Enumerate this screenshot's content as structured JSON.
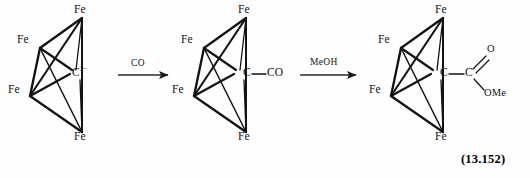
{
  "figure": {
    "equation_number": "(13.152)",
    "background_color": "#fefefe",
    "line_color": "#111111"
  },
  "structures": [
    {
      "id": "reactant-carbide-cluster",
      "metal_labels": [
        "Fe",
        "Fe",
        "Fe",
        "Fe"
      ],
      "center_atom": "C",
      "center_charge": "2−",
      "substituents": []
    },
    {
      "id": "carbonyl-adduct-cluster",
      "metal_labels": [
        "Fe",
        "Fe",
        "Fe",
        "Fe"
      ],
      "center_atom": "C",
      "center_charge": "",
      "substituents": [
        "CO"
      ]
    },
    {
      "id": "ester-product-cluster",
      "metal_labels": [
        "Fe",
        "Fe",
        "Fe",
        "Fe"
      ],
      "center_atom": "C",
      "center_charge": "",
      "substituents": [
        "C",
        "O",
        "OMe"
      ]
    }
  ],
  "arrows": [
    {
      "id": "arrow-co",
      "reagent": "CO"
    },
    {
      "id": "arrow-meoh",
      "reagent": "MeOH"
    }
  ],
  "labels": {
    "fe": "Fe",
    "c": "C",
    "co": "CO",
    "o": "O",
    "ome": "OMe",
    "charge_2minus": "2−",
    "reagent_co": "CO",
    "reagent_meoh": "MeOH",
    "equation": "(13.152)"
  }
}
